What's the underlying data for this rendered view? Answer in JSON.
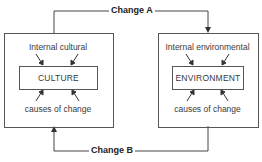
{
  "diagram": {
    "flows": {
      "change_a": "Change A",
      "change_b": "Change B"
    },
    "left_box": {
      "top_label": "Internal cultural",
      "center_label": "CULTURE",
      "bottom_label": "causes of change"
    },
    "right_box": {
      "top_label": "Internal environmental",
      "center_label": "ENVIRONMENT",
      "bottom_label": "causes of change"
    },
    "colors": {
      "line": "#444444",
      "text": "#333333",
      "background": "#ffffff"
    }
  }
}
